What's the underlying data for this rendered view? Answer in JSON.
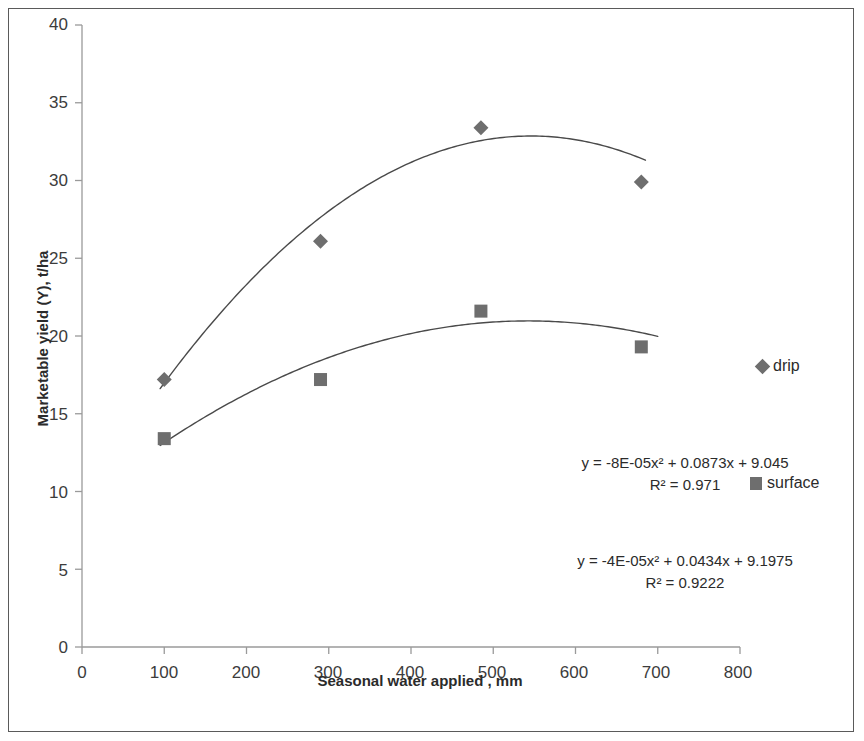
{
  "axes": {
    "x_title": "Seasonal water applied , mm",
    "y_title": "Marketable yield (Y), t/ha",
    "x_ticks": [
      "0",
      "100",
      "200",
      "300",
      "400",
      "500",
      "600",
      "700",
      "800"
    ],
    "y_ticks": [
      "0",
      "5",
      "10",
      "15",
      "20",
      "25",
      "30",
      "35",
      "40"
    ]
  },
  "legend": {
    "drip": "drip",
    "surface": "surface"
  },
  "annotations": {
    "drip_equation": "y = -8E-05x² + 0.0873x + 9.045",
    "drip_r2": "R² = 0.971",
    "surface_equation": "y = -4E-05x² + 0.0434x + 9.1975",
    "surface_r2": "R² = 0.9222"
  },
  "colors": {
    "marker": "#6e6e6e",
    "trendline": "#4a4a4a",
    "axis": "#9a9a9a",
    "text": "#2b2b2b",
    "frame": "#5a5a5a"
  },
  "chart_data": {
    "type": "scatter",
    "title": "",
    "xlabel": "Seasonal water applied , mm",
    "ylabel": "Marketable yield (Y), t/ha",
    "xlim": [
      0,
      800
    ],
    "ylim": [
      0,
      40
    ],
    "xticks": [
      0,
      100,
      200,
      300,
      400,
      500,
      600,
      700,
      800
    ],
    "yticks": [
      0,
      5,
      10,
      15,
      20,
      25,
      30,
      35,
      40
    ],
    "grid": false,
    "legend_position": "right",
    "series": [
      {
        "name": "drip",
        "marker": "diamond",
        "color": "#6e6e6e",
        "x": [
          100,
          290,
          485,
          680
        ],
        "y": [
          17.2,
          26.1,
          33.4,
          29.9
        ],
        "trendline": {
          "type": "quadratic",
          "a": -8e-05,
          "b": 0.0873,
          "c": 9.045,
          "equation": "y = -8E-05x² + 0.0873x + 9.045",
          "r2": 0.971,
          "x_start": 95,
          "x_end": 685
        }
      },
      {
        "name": "surface",
        "marker": "square",
        "color": "#6e6e6e",
        "x": [
          100,
          290,
          485,
          680
        ],
        "y": [
          13.4,
          17.2,
          21.6,
          19.3
        ],
        "trendline": {
          "type": "quadratic",
          "a": -4e-05,
          "b": 0.0434,
          "c": 9.1975,
          "equation": "y = -4E-05x² + 0.0434x + 9.1975",
          "r2": 0.9222,
          "x_start": 95,
          "x_end": 700
        }
      }
    ]
  }
}
